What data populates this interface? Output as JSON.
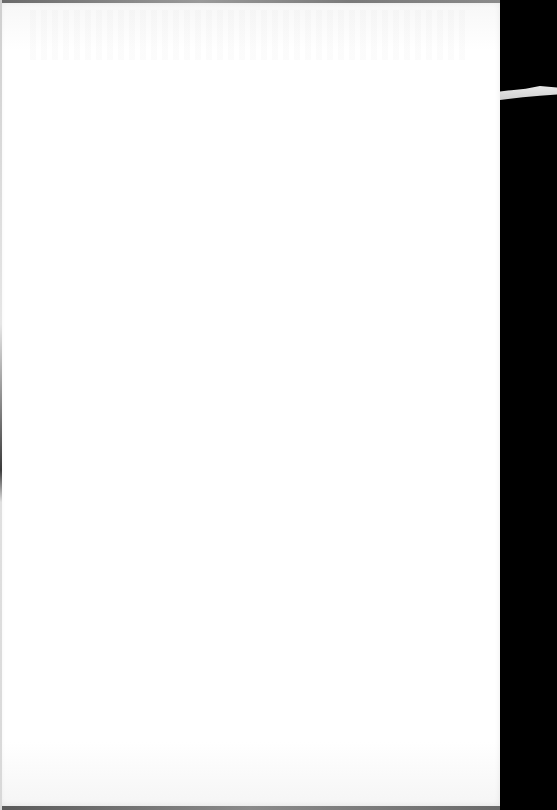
{
  "document": {
    "type": "scanned-page",
    "content": "blank",
    "page_color": "#ffffff",
    "background_color": "#000000",
    "edge_shadow_color": "#7a7a7a",
    "tab_color": "#dcdcdc"
  }
}
